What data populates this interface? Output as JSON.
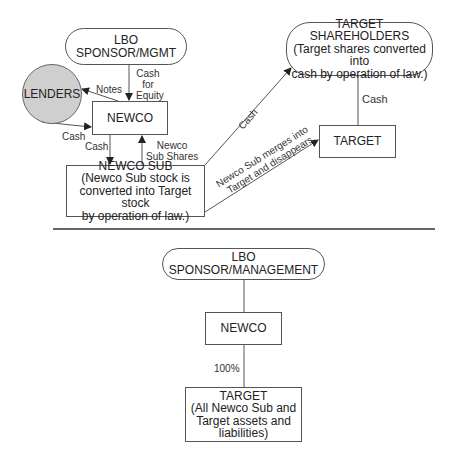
{
  "top_diagram": {
    "nodes": {
      "lbo_sponsor": "LBO SPONSOR/MGMT",
      "lenders": "LENDERS",
      "newco": "NEWCO",
      "newco_sub": {
        "title": "NEWCO SUB",
        "line1": "(Newco Sub stock is",
        "line2": "converted into Target stock",
        "line3": "by operation of law.)"
      },
      "target_shareholders": {
        "title": "TARGET SHAREHOLDERS",
        "line1": "(Target shares converted into",
        "line2": "cash by operation of law.)"
      },
      "target": "TARGET"
    },
    "edges": {
      "cash_for_equity": {
        "line1": "Cash",
        "line2": "for",
        "line3": "Equity"
      },
      "notes": "Notes",
      "lenders_cash": "Cash",
      "newco_to_sub_cash": "Cash",
      "newco_sub_shares": {
        "line1": "Newco",
        "line2": "Sub Shares"
      },
      "sub_to_shareholders_cash": "Cash",
      "shareholders_target_cash": "Cash",
      "merger": {
        "line1": "Newco Sub merges into",
        "line2": "Target and disappears."
      }
    }
  },
  "bottom_diagram": {
    "nodes": {
      "lbo_sponsor": "LBO SPONSOR/MANAGEMENT",
      "newco": "NEWCO",
      "target": {
        "title": "TARGET",
        "line1": "(All Newco Sub and",
        "line2": "Target assets and",
        "line3": "liabilities)"
      }
    },
    "edges": {
      "ownership": "100%"
    }
  },
  "colors": {
    "line": "#555555",
    "lenders_fill": "#cfcfcf",
    "text": "#222222"
  }
}
